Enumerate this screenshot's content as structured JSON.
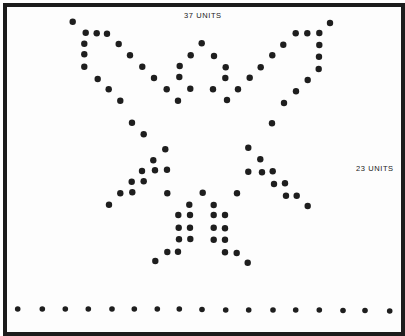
{
  "labels": {
    "width": "37 UNITS",
    "height": "23 UNITS"
  },
  "colors": {
    "dot": "#1e1e1e",
    "border": "#1c1c1c",
    "background": "#fdfdfd"
  },
  "figure": {
    "dot_radius": 3.2,
    "baseline_dot_radius": 2.8,
    "figure_dots": [
      [
        72.7,
        21.7
      ],
      [
        85.7,
        32.7
      ],
      [
        96.7,
        33.3
      ],
      [
        107,
        33.7
      ],
      [
        84.3,
        43.7
      ],
      [
        118.7,
        44
      ],
      [
        84.3,
        54.3
      ],
      [
        130,
        55.3
      ],
      [
        84.3,
        66.7
      ],
      [
        142.3,
        66.7
      ],
      [
        97.7,
        79
      ],
      [
        154,
        78
      ],
      [
        108.7,
        89.3
      ],
      [
        120.3,
        100.7
      ],
      [
        201.7,
        43.3
      ],
      [
        190.7,
        55.3
      ],
      [
        214,
        56
      ],
      [
        179.7,
        66
      ],
      [
        225.7,
        67.3
      ],
      [
        179.3,
        77
      ],
      [
        225.3,
        78
      ],
      [
        166.7,
        89.3
      ],
      [
        190.3,
        88.7
      ],
      [
        213,
        89.3
      ],
      [
        238,
        89.3
      ],
      [
        178,
        100.7
      ],
      [
        227,
        100
      ],
      [
        330,
        23
      ],
      [
        295.7,
        33.3
      ],
      [
        307.3,
        33.3
      ],
      [
        319.3,
        33
      ],
      [
        283.3,
        44.7
      ],
      [
        319.3,
        45
      ],
      [
        272.3,
        55.3
      ],
      [
        319,
        56.7
      ],
      [
        260.7,
        67.3
      ],
      [
        318.7,
        69
      ],
      [
        249.7,
        77.7
      ],
      [
        307.7,
        80
      ],
      [
        296,
        91.3
      ],
      [
        284,
        103
      ],
      [
        132,
        122.7
      ],
      [
        143.7,
        134.3
      ],
      [
        165.3,
        149.3
      ],
      [
        153.3,
        160.3
      ],
      [
        142,
        171
      ],
      [
        155,
        170.3
      ],
      [
        167,
        169.7
      ],
      [
        131.7,
        181.7
      ],
      [
        143.7,
        181.3
      ],
      [
        120.3,
        193.3
      ],
      [
        132.3,
        192.3
      ],
      [
        167.3,
        193.3
      ],
      [
        109,
        204.7
      ],
      [
        189.3,
        204.7
      ],
      [
        272,
        123.3
      ],
      [
        248.3,
        147.7
      ],
      [
        260.3,
        159.3
      ],
      [
        248.3,
        171.7
      ],
      [
        262,
        172.3
      ],
      [
        272.7,
        171.3
      ],
      [
        274,
        184
      ],
      [
        285,
        183.3
      ],
      [
        202.7,
        192.7
      ],
      [
        237,
        193.3
      ],
      [
        286,
        195.7
      ],
      [
        296.7,
        195.7
      ],
      [
        213.7,
        205
      ],
      [
        307.7,
        206
      ],
      [
        178.3,
        215
      ],
      [
        190,
        215
      ],
      [
        213.7,
        215
      ],
      [
        225,
        215
      ],
      [
        178.7,
        227.7
      ],
      [
        190,
        227.7
      ],
      [
        213.7,
        227.7
      ],
      [
        225,
        228.3
      ],
      [
        179,
        239.3
      ],
      [
        190.3,
        239
      ],
      [
        213.7,
        239.7
      ],
      [
        225,
        239.7
      ],
      [
        167.3,
        252
      ],
      [
        178,
        251.7
      ],
      [
        225,
        252.3
      ],
      [
        236.7,
        253
      ],
      [
        155.3,
        261
      ],
      [
        247.7,
        262.7
      ]
    ],
    "baseline_dots": [
      [
        17.7,
        309
      ],
      [
        42.3,
        309
      ],
      [
        65.3,
        309
      ],
      [
        88.3,
        309
      ],
      [
        112,
        309
      ],
      [
        134.3,
        309
      ],
      [
        157.3,
        309
      ],
      [
        179.3,
        309
      ],
      [
        202,
        309.5
      ],
      [
        225.7,
        310
      ],
      [
        248.7,
        310
      ],
      [
        273,
        310
      ],
      [
        295.7,
        310
      ],
      [
        319.3,
        310
      ],
      [
        343,
        310.5
      ],
      [
        365,
        310.5
      ],
      [
        389.7,
        311
      ]
    ]
  }
}
